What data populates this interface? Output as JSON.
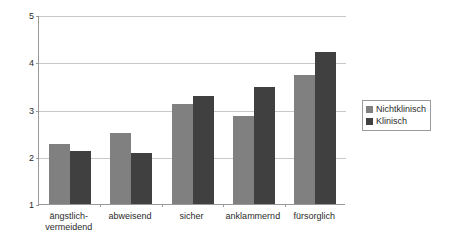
{
  "chart_data": {
    "type": "bar",
    "title": "",
    "subtitle": "",
    "xlabel": "",
    "ylabel": "",
    "ylim": [
      1,
      5
    ],
    "yticks": [
      1,
      2,
      3,
      4,
      5
    ],
    "ytick_labels": [
      "1",
      "2",
      "3",
      "4",
      "5"
    ],
    "grid": true,
    "legend_position": "right",
    "categories": [
      "ängstlich-\nvermeidend",
      "abweisend",
      "sicher",
      "anklammernd",
      "fürsorglich"
    ],
    "series": [
      {
        "name": "Nichtklinisch",
        "color": "#808080",
        "values": [
          2.28,
          2.5,
          3.12,
          2.86,
          3.72
        ]
      },
      {
        "name": "Klinisch",
        "color": "#404040",
        "values": [
          2.13,
          2.09,
          3.29,
          3.48,
          4.21
        ]
      }
    ]
  },
  "legend": {
    "items": [
      {
        "label": "Nichtklinisch",
        "color": "#808080"
      },
      {
        "label": "Klinisch",
        "color": "#404040"
      }
    ]
  },
  "axis": {
    "line_color": "#9a9a9a",
    "grid_color": "#c9c9c9"
  }
}
